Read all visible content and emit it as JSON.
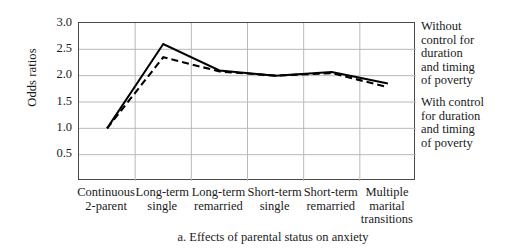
{
  "chart_data": {
    "type": "line",
    "title": "",
    "caption": "a. Effects of parental status on anxiety",
    "xlabel": "",
    "ylabel": "Odds ratios",
    "categories": [
      "Continuous\n2-parent",
      "Long-term\nsingle",
      "Long-term\nremarried",
      "Short-term\nsingle",
      "Short-term\nremarried",
      "Multiple\nmarital\ntransitions"
    ],
    "yticks": [
      "0.5",
      "1.0",
      "1.5",
      "2.0",
      "2.5",
      "3.0"
    ],
    "ytick_values": [
      0.5,
      1.0,
      1.5,
      2.0,
      2.5,
      3.0
    ],
    "ylim": [
      0.0,
      3.0
    ],
    "grid": "horizontal-and-vertical",
    "legend_position": "right",
    "series": [
      {
        "name": "Without control for duration and timing of poverty",
        "style": "solid",
        "color": "#000000",
        "values": [
          1.0,
          2.6,
          2.1,
          2.0,
          2.07,
          1.85
        ]
      },
      {
        "name": "With control for duration and timing of poverty",
        "style": "dashed",
        "color": "#000000",
        "values": [
          1.0,
          2.35,
          2.08,
          2.0,
          2.05,
          1.78
        ]
      }
    ]
  },
  "legend": {
    "without": "Without\ncontrol for\nduration\nand timing\nof poverty",
    "with": "With control\nfor duration\nand timing\nof poverty"
  }
}
